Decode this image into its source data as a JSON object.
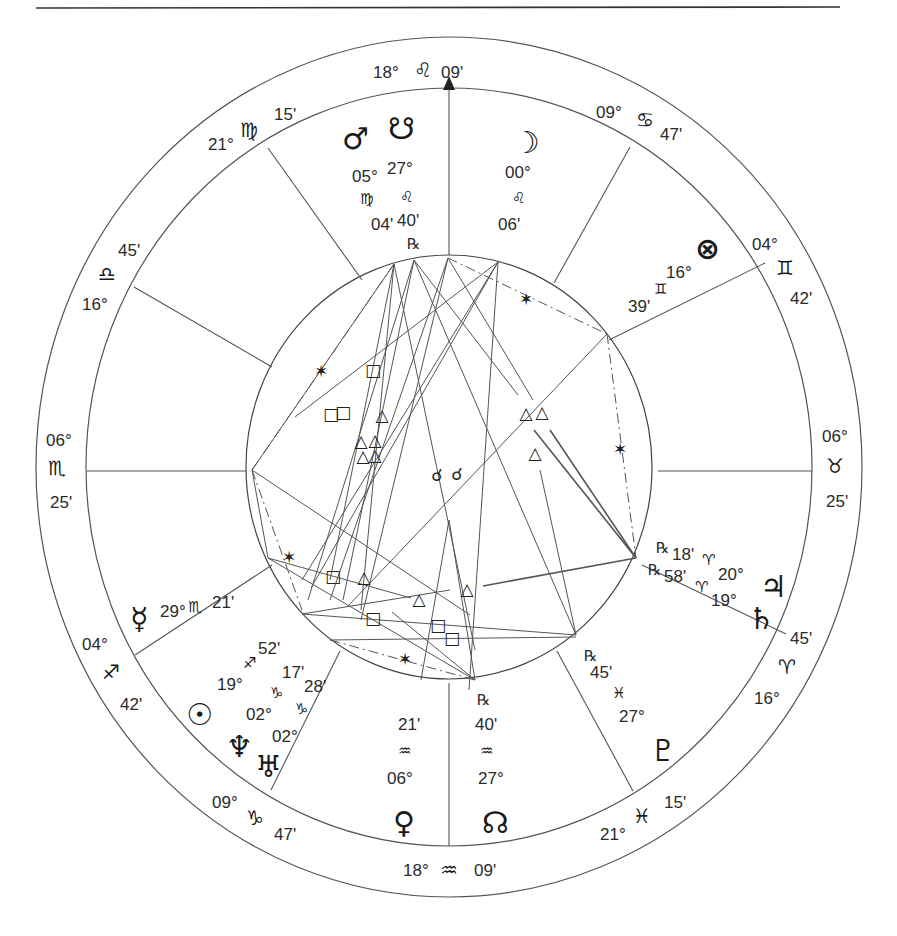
{
  "top_rule": true,
  "center": [
    449,
    467
  ],
  "circles": {
    "outer": {
      "rx": 413,
      "ry": 430
    },
    "middle": {
      "rx": 363,
      "ry": 379
    },
    "inner": {
      "rx": 203,
      "ry": 212
    }
  },
  "glyphs": {
    "aries": "♈",
    "taurus": "♉",
    "gemini": "♊",
    "cancer": "♋",
    "leo": "♌",
    "virgo": "♍",
    "libra": "♎",
    "scorpio": "♏",
    "sagittarius": "♐",
    "capricorn": "♑",
    "aquarius": "♒",
    "pisces": "♓",
    "sun": "☉",
    "moon": "☽",
    "mercury": "☿",
    "venus": "♀",
    "mars": "♂",
    "jupiter": "♃",
    "saturn": "♄",
    "uranus": "♅",
    "neptune": "♆",
    "pluto": "♇",
    "north_node": "☊",
    "south_node": "☋",
    "part_of_fortune": "⊗",
    "retrograde": "℞",
    "trine": "△",
    "square": "□",
    "sextile": "✶",
    "conjunction": "☌"
  },
  "house_cusps": [
    {
      "id": "mc",
      "deg": "18°",
      "sign": "leo",
      "min": "09'"
    },
    {
      "id": "h11",
      "deg": "09°",
      "sign": "cancer",
      "min": "47'"
    },
    {
      "id": "h12",
      "deg": "04°",
      "sign": "gemini",
      "min": "42'"
    },
    {
      "id": "asc_right",
      "deg": "06°",
      "sign": "taurus",
      "min": "25'"
    },
    {
      "id": "h2",
      "deg": "16°",
      "sign": "aries",
      "min": "45'"
    },
    {
      "id": "h3",
      "deg": "21°",
      "sign": "pisces",
      "min": "15'"
    },
    {
      "id": "ic",
      "deg": "18°",
      "sign": "aquarius",
      "min": "09'"
    },
    {
      "id": "h5",
      "deg": "09°",
      "sign": "capricorn",
      "min": "47'"
    },
    {
      "id": "h6",
      "deg": "04°",
      "sign": "sagittarius",
      "min": "42'"
    },
    {
      "id": "desc_left",
      "deg": "06°",
      "sign": "scorpio",
      "min": "25'"
    },
    {
      "id": "h8",
      "deg": "16°",
      "sign": "libra",
      "min": "45'"
    },
    {
      "id": "h9",
      "deg": "21°",
      "sign": "virgo",
      "min": "15'"
    }
  ],
  "planets": [
    {
      "name": "mars",
      "deg": "05°",
      "sign": "virgo",
      "min": "04'",
      "retro": false
    },
    {
      "name": "south_node",
      "deg": "27°",
      "sign": "leo",
      "min": "40'",
      "retro": true
    },
    {
      "name": "moon",
      "deg": "00°",
      "sign": "leo",
      "min": "06'",
      "retro": false
    },
    {
      "name": "part_of_fortune",
      "deg": "16°",
      "sign": "gemini",
      "min": "39'",
      "retro": false
    },
    {
      "name": "jupiter",
      "deg": "20°",
      "sign": "aries",
      "min": "18'",
      "retro": true
    },
    {
      "name": "saturn",
      "deg": "19°",
      "sign": "aries",
      "min": "58'",
      "retro": true
    },
    {
      "name": "pluto",
      "deg": "27°",
      "sign": "pisces",
      "min": "45'",
      "retro": true
    },
    {
      "name": "north_node",
      "deg": "27°",
      "sign": "aquarius",
      "min": "40'",
      "retro": true
    },
    {
      "name": "venus",
      "deg": "06°",
      "sign": "aquarius",
      "min": "21'",
      "retro": false
    },
    {
      "name": "uranus",
      "deg": "02°",
      "sign": "capricorn",
      "min": "28'",
      "retro": false
    },
    {
      "name": "neptune",
      "deg": "02°",
      "sign": "capricorn",
      "min": "17'",
      "retro": false
    },
    {
      "name": "sun",
      "deg": "19°",
      "sign": "sagittarius",
      "min": "52'",
      "retro": false
    },
    {
      "name": "mercury",
      "deg": "29°",
      "sign": "scorpio",
      "min": "21'",
      "retro": false
    }
  ],
  "labels": {
    "mc_deg": "18°",
    "mc_min": "09'",
    "h11_deg": "09°",
    "h11_min": "47'",
    "h12_deg": "04°",
    "h12_min": "42'",
    "h1r_deg": "06°",
    "h1r_min": "25'",
    "h2_deg": "16°",
    "h2_min": "45'",
    "h3_deg": "21°",
    "h3_min": "15'",
    "ic_deg": "18°",
    "ic_min": "09'",
    "h5_deg": "09°",
    "h5_min": "47'",
    "h6_deg": "04°",
    "h6_min": "42'",
    "h7l_deg": "06°",
    "h7l_min": "25'",
    "h8_deg": "16°",
    "h8_min": "45'",
    "h9_deg": "21°",
    "h9_min": "15'",
    "mars_deg": "05°",
    "mars_min": "04'",
    "snode_deg": "27°",
    "snode_min": "40'",
    "moon_deg": "00°",
    "moon_min": "06'",
    "pof_deg": "16°",
    "pof_min": "39'",
    "jup_deg": "20°",
    "jup_min": "18'",
    "sat_deg": "19°",
    "sat_min": "58'",
    "pluto_deg": "27°",
    "pluto_min": "45'",
    "nnode_deg": "27°",
    "nnode_min": "40'",
    "venus_deg": "06°",
    "venus_min": "21'",
    "uranus_deg": "02°",
    "uranus_min": "28'",
    "neptune_deg": "02°",
    "neptune_min": "17'",
    "sun_deg": "19°",
    "sun_min": "52'",
    "mercury_deg": "29°",
    "mercury_min": "21'"
  },
  "aspect_symbols": [
    {
      "type": "sextile",
      "x": 321,
      "y": 371
    },
    {
      "type": "square",
      "x": 373,
      "y": 370
    },
    {
      "type": "square",
      "x": 331,
      "y": 414
    },
    {
      "type": "square",
      "x": 343,
      "y": 412
    },
    {
      "type": "trine",
      "x": 382,
      "y": 415
    },
    {
      "type": "trine",
      "x": 361,
      "y": 441
    },
    {
      "type": "trine",
      "x": 375,
      "y": 440
    },
    {
      "type": "trine",
      "x": 363,
      "y": 456
    },
    {
      "type": "trine",
      "x": 375,
      "y": 455
    },
    {
      "type": "sextile",
      "x": 526,
      "y": 299
    },
    {
      "type": "trine",
      "x": 526,
      "y": 413
    },
    {
      "type": "trine",
      "x": 542,
      "y": 412
    },
    {
      "type": "trine",
      "x": 535,
      "y": 453
    },
    {
      "type": "sextile",
      "x": 620,
      "y": 449
    },
    {
      "type": "conjunction",
      "x": 437,
      "y": 475
    },
    {
      "type": "conjunction",
      "x": 457,
      "y": 474
    },
    {
      "type": "sextile",
      "x": 289,
      "y": 557
    },
    {
      "type": "square",
      "x": 333,
      "y": 576
    },
    {
      "type": "trine",
      "x": 364,
      "y": 577
    },
    {
      "type": "trine",
      "x": 419,
      "y": 599
    },
    {
      "type": "trine",
      "x": 467,
      "y": 589
    },
    {
      "type": "square",
      "x": 373,
      "y": 618
    },
    {
      "type": "square",
      "x": 438,
      "y": 625
    },
    {
      "type": "square",
      "x": 452,
      "y": 638
    },
    {
      "type": "sextile",
      "x": 405,
      "y": 659
    }
  ]
}
